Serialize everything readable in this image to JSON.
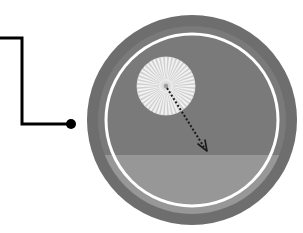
{
  "figure": {
    "canvas": {
      "width": 303,
      "height": 233,
      "background": "#ffffff"
    },
    "title": "",
    "caption": ""
  },
  "leader": {
    "name": "callout-leader-line",
    "stroke_color": "#000000",
    "stroke_width": 3,
    "points": "0,38 22,38 22,124 70,124",
    "endpoint_dot": {
      "cx": 71,
      "cy": 124,
      "r": 5,
      "fill": "#000000"
    }
  },
  "disc": {
    "name": "radar-dome",
    "center": {
      "cx": 192,
      "cy": 120
    },
    "outer_ring": {
      "r": 105,
      "fill": "#6e6e6e"
    },
    "inner_face": {
      "r": 94,
      "fill": "#7a7a7a"
    },
    "white_ring": {
      "r": 86,
      "stroke": "#ffffff",
      "stroke_width": 3
    },
    "lower_band": {
      "fill": "#979797",
      "horizon_y": 155
    },
    "colors": {
      "outer_ring": "#6e6e6e",
      "inner_face": "#7a7a7a",
      "lower_band": "#979797",
      "white_ring": "#ffffff",
      "background": "#ffffff"
    }
  },
  "rosette": {
    "name": "radial-spoke-burst",
    "center": {
      "cx": 166,
      "cy": 86
    },
    "outer_radius": 29,
    "inner_radius": 3,
    "spoke_count": 44,
    "spoke_color": "#f2f2f2",
    "hub_color": "#b9b9b9",
    "halo_color": "#cfcfcf"
  },
  "arrow": {
    "name": "dashed-direction-arrow",
    "from": {
      "x": 167,
      "y": 88
    },
    "to": {
      "x": 207,
      "y": 151
    },
    "stroke_color": "#1a1a1a",
    "stroke_width": 2,
    "dash_pattern": "2 2",
    "arrowhead": "open-v"
  }
}
